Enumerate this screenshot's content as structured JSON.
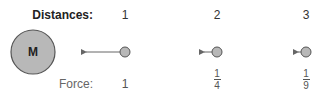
{
  "labels": {
    "distances": "Distances:",
    "force": "Force:",
    "mass": "M"
  },
  "columns": [
    {
      "distance": "1",
      "force": "1",
      "force_num": null,
      "force_den": null
    },
    {
      "distance": "2",
      "force": null,
      "force_num": "1",
      "force_den": "4"
    },
    {
      "distance": "3",
      "force": null,
      "force_num": "1",
      "force_den": "9"
    }
  ],
  "colors": {
    "circle_fill": "#b8b8b8",
    "circle_stroke": "#555555",
    "arrow": "#666666"
  },
  "icons": {
    "arrow": "left-arrow",
    "mass": "large-circle",
    "object": "small-circle"
  }
}
